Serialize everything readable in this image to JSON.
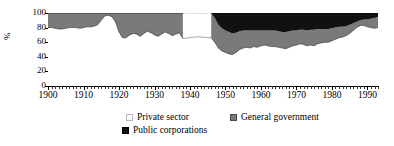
{
  "chart_data": {
    "type": "area",
    "stacked": true,
    "title": "",
    "xlabel": "",
    "ylabel": "%",
    "ylim": [
      0,
      100
    ],
    "yticks": [
      0,
      20,
      40,
      60,
      80,
      100
    ],
    "xlim": [
      1900,
      1993
    ],
    "xticks": [
      1900,
      1910,
      1920,
      1930,
      1940,
      1950,
      1960,
      1970,
      1980,
      1990
    ],
    "xtick_labels": [
      "1900",
      "1910",
      "1920",
      "1930",
      "1940",
      "1950",
      "1960",
      "1970",
      "1980",
      "1990"
    ],
    "grid": false,
    "legend_position": "bottom",
    "minor_tick_interval": 1,
    "colors": {
      "private_sector": "#ffffff",
      "general_government": "#7a7a7a",
      "public_corporations": "#111111",
      "axis": "#000000"
    },
    "gap_years": [
      1939,
      1940,
      1941,
      1942,
      1943,
      1944,
      1945
    ],
    "series": [
      {
        "name": "Private sector",
        "key": "private_sector",
        "values": [
          80,
          80,
          79,
          78,
          78,
          79,
          80,
          80,
          80,
          79,
          80,
          81,
          81,
          82,
          84,
          90,
          96,
          97,
          95,
          88,
          74,
          66,
          66,
          70,
          72,
          71,
          68,
          72,
          75,
          73,
          70,
          68,
          71,
          74,
          72,
          69,
          71,
          73,
          65,
          68,
          72,
          74,
          74,
          73,
          71,
          68,
          66,
          60,
          52,
          48,
          46,
          44,
          43,
          46,
          50,
          52,
          53,
          52,
          54,
          53,
          55,
          56,
          55,
          54,
          54,
          53,
          52,
          51,
          53,
          55,
          56,
          58,
          57,
          55,
          56,
          55,
          58,
          59,
          60,
          60,
          62,
          64,
          66,
          67,
          69,
          72,
          76,
          80,
          83,
          83,
          81,
          80,
          79,
          80
        ]
      },
      {
        "name": "General government",
        "key": "general_government",
        "values": [
          20,
          20,
          21,
          22,
          22,
          21,
          20,
          20,
          20,
          21,
          20,
          19,
          19,
          18,
          16,
          10,
          4,
          3,
          5,
          12,
          26,
          34,
          34,
          30,
          28,
          29,
          32,
          28,
          25,
          27,
          30,
          32,
          29,
          26,
          28,
          31,
          29,
          27,
          35,
          32,
          28,
          26,
          26,
          27,
          29,
          32,
          34,
          33,
          32,
          31,
          30,
          30,
          29,
          27,
          25,
          24,
          23,
          24,
          22,
          23,
          21,
          20,
          21,
          22,
          22,
          22,
          22,
          23,
          22,
          21,
          20,
          19,
          20,
          21,
          21,
          22,
          20,
          19,
          18,
          18,
          17,
          16,
          15,
          14,
          13,
          12,
          10,
          8,
          7,
          8,
          10,
          12,
          14,
          15
        ]
      },
      {
        "name": "Public corporations",
        "key": "public_corporations",
        "values": [
          0,
          0,
          0,
          0,
          0,
          0,
          0,
          0,
          0,
          0,
          0,
          0,
          0,
          0,
          0,
          0,
          0,
          0,
          0,
          0,
          0,
          0,
          0,
          0,
          0,
          0,
          0,
          0,
          0,
          0,
          0,
          0,
          0,
          0,
          0,
          0,
          0,
          0,
          0,
          0,
          0,
          0,
          0,
          0,
          0,
          0,
          0,
          7,
          16,
          21,
          24,
          26,
          28,
          27,
          25,
          24,
          24,
          24,
          24,
          24,
          24,
          24,
          24,
          24,
          24,
          25,
          26,
          26,
          25,
          24,
          24,
          23,
          23,
          24,
          23,
          23,
          22,
          22,
          22,
          22,
          21,
          20,
          19,
          19,
          18,
          16,
          14,
          12,
          10,
          9,
          9,
          8,
          7,
          5
        ]
      }
    ]
  },
  "axis": {
    "y_title": "%",
    "y_tick_labels": [
      "100",
      "80",
      "60",
      "40",
      "20",
      "0"
    ]
  },
  "legend": {
    "private_label": "Private sector",
    "government_label": "General government",
    "public_corporations_label": "Public corporations"
  }
}
